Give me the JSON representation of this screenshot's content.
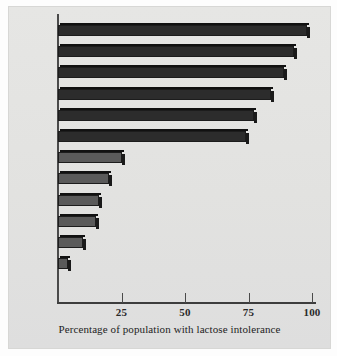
{
  "chart_data": {
    "type": "bar",
    "orientation": "horizontal",
    "title": "",
    "xlabel": "Percentage of population with lactose intolerance",
    "ylabel": "",
    "xlim": [
      0,
      100
    ],
    "xticks": [
      25,
      50,
      75,
      100
    ],
    "xticklabels": [
      "25",
      "50",
      "75",
      "100"
    ],
    "grid": false,
    "legend": null,
    "categories": [
      "Thai",
      "Ibo",
      "Yoruba",
      "Chinese",
      "Ganda",
      "Hausa",
      "Fula",
      "Tussi",
      "Finnish",
      "U.S.A.\n(white)",
      "Swiss",
      "Swedish"
    ],
    "values": [
      98,
      93,
      89,
      84,
      77,
      74,
      25,
      20,
      16,
      15,
      10,
      4
    ],
    "bar_color": "#4b4b4b",
    "bar_edge_color": "#1c1c1c",
    "plot_background": "#e3e3e1",
    "axis_color": "#3d3d3d"
  },
  "caption": {
    "text": "Percentage of population with lactose intolerance"
  }
}
